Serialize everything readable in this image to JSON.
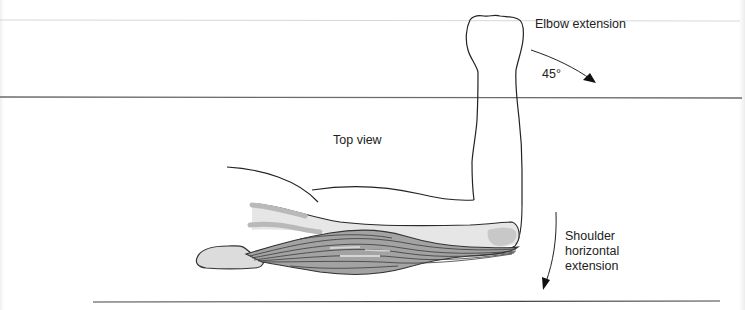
{
  "figure": {
    "labels": {
      "elbow_extension": "Elbow extension",
      "angle": "45°",
      "top_view": "Top view",
      "shoulder_line1": "Shoulder",
      "shoulder_line2": "horizontal",
      "shoulder_line3": "extension"
    },
    "colors": {
      "line": "#222222",
      "rule_light": "#d6d6d6",
      "rule_dark": "#6e6e6e",
      "bone_fill": "#d9d9d9",
      "muscle_fill": "#9a9a9a",
      "muscle_stroke": "#3a3a3a"
    },
    "arrows": [
      {
        "name": "elbow-extension-arrow",
        "direction": "down-right"
      },
      {
        "name": "shoulder-horizontal-extension-arrow",
        "direction": "down"
      }
    ]
  }
}
